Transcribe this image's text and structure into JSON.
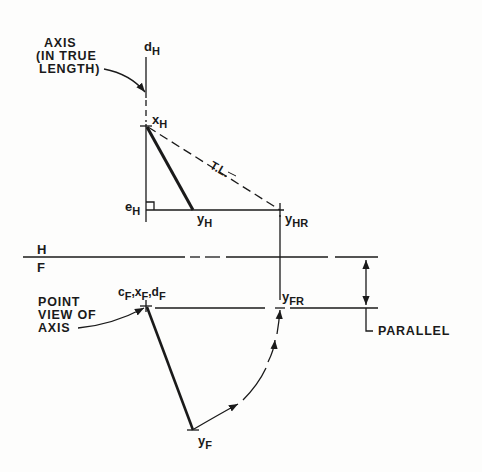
{
  "diagram": {
    "type": "descriptive-geometry-rotation",
    "notes": {
      "axis_note": [
        "AXIS",
        "(IN TRUE",
        "LENGTH)"
      ],
      "point_view_note": [
        "POINT",
        "VIEW OF",
        "AXIS"
      ],
      "parallel_note": "PARALLEL",
      "true_length": "T.L."
    },
    "fold_line": {
      "top": "H",
      "bottom": "F"
    },
    "points": {
      "dH": {
        "base": "d",
        "sub": "H"
      },
      "xH": {
        "base": "x",
        "sub": "H"
      },
      "eH": {
        "base": "e",
        "sub": "H"
      },
      "yH": {
        "base": "y",
        "sub": "H"
      },
      "yHR": {
        "base": "y",
        "sub": "HR"
      },
      "yFR": {
        "base": "y",
        "sub": "FR"
      },
      "yF": {
        "base": "y",
        "sub": "F"
      },
      "cF": {
        "base": "c",
        "sub": "F"
      },
      "xF": {
        "base": "x",
        "sub": "F"
      },
      "dF": {
        "base": "d",
        "sub": "F"
      }
    },
    "colors": {
      "ink": "#1a1a1a",
      "paper": "#fdfdfc"
    }
  }
}
